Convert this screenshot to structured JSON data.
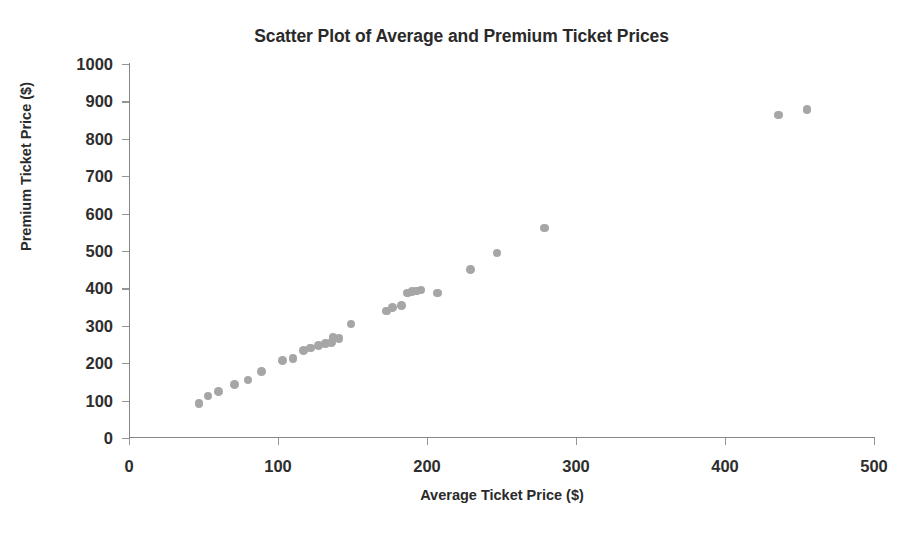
{
  "chart_data": {
    "type": "scatter",
    "title": "Scatter Plot of Average and Premium Ticket Prices",
    "xlabel": "Average Ticket Price ($)",
    "ylabel": "Premium Ticket Price ($)",
    "xlim": [
      0,
      500
    ],
    "ylim": [
      0,
      1000
    ],
    "xticks": [
      0,
      100,
      200,
      300,
      400,
      500
    ],
    "yticks": [
      0,
      100,
      200,
      300,
      400,
      500,
      600,
      700,
      800,
      900,
      1000
    ],
    "grid": false,
    "legend": null,
    "marker_color": "#a6a6a6",
    "series": [
      {
        "name": "Tickets",
        "points": [
          [
            47,
            92
          ],
          [
            53,
            112
          ],
          [
            60,
            124
          ],
          [
            71,
            143
          ],
          [
            80,
            155
          ],
          [
            89,
            178
          ],
          [
            103,
            207
          ],
          [
            110,
            212
          ],
          [
            117,
            234
          ],
          [
            122,
            241
          ],
          [
            127,
            247
          ],
          [
            132,
            252
          ],
          [
            136,
            255
          ],
          [
            137,
            268
          ],
          [
            141,
            266
          ],
          [
            149,
            305
          ],
          [
            173,
            340
          ],
          [
            177,
            349
          ],
          [
            183,
            355
          ],
          [
            187,
            388
          ],
          [
            190,
            392
          ],
          [
            193,
            393
          ],
          [
            196,
            396
          ],
          [
            207,
            388
          ],
          [
            229,
            451
          ],
          [
            247,
            495
          ],
          [
            279,
            561
          ],
          [
            436,
            864
          ],
          [
            455,
            878
          ]
        ]
      }
    ]
  }
}
